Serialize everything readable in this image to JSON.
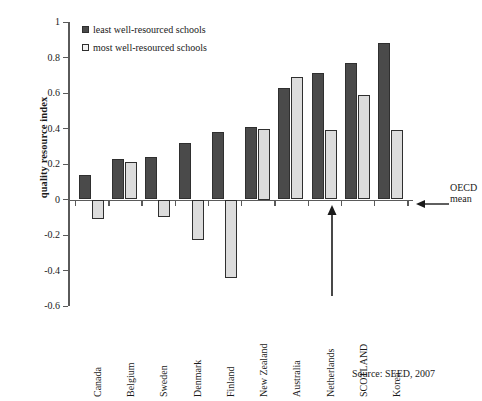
{
  "chart_data": {
    "type": "bar",
    "title": "",
    "xlabel": "",
    "ylabel": "quality resource index",
    "ylim": [
      -0.6,
      1
    ],
    "ytick_labels": [
      "1",
      "0.8",
      "0.6",
      "0.4",
      "0.2",
      "0",
      "-0.2",
      "-0.4",
      "-0.6"
    ],
    "ytick_values": [
      1,
      0.8,
      0.6,
      0.4,
      0.2,
      0,
      -0.2,
      -0.4,
      -0.6
    ],
    "grid": false,
    "legend_position": "top-left",
    "categories": [
      "Canada",
      "Belgium",
      "Sweden",
      "Denmark",
      "Finland",
      "New Zealand",
      "Australia",
      "Netherlands",
      "SCOTLAND",
      "Korea"
    ],
    "series": [
      {
        "name": "least well-resourced schools",
        "color": "#4a4a4a",
        "values": [
          0.14,
          0.23,
          0.24,
          0.32,
          0.38,
          0.41,
          0.63,
          0.71,
          0.77,
          0.88
        ]
      },
      {
        "name": "most well-resourced schools",
        "color": "#dcdcdc",
        "values": [
          -0.11,
          0.21,
          -0.1,
          -0.23,
          -0.44,
          0.4,
          0.69,
          0.39,
          0.59,
          0.39
        ]
      }
    ],
    "annotations": [
      {
        "name": "oecd-mean",
        "text": "OECD mean",
        "text_line1": "OECD",
        "text_line2": "mean",
        "points_to": "zero-line",
        "arrow": "left"
      },
      {
        "name": "scotland-pointer",
        "text": "",
        "points_to": "SCOTLAND",
        "arrow": "up"
      }
    ],
    "source": "Source: SEED, 2007"
  },
  "legend": {
    "items": [
      {
        "label": "least well-resourced schools",
        "swatch": "dark"
      },
      {
        "label": "most well-resourced schools",
        "swatch": "light"
      }
    ]
  }
}
